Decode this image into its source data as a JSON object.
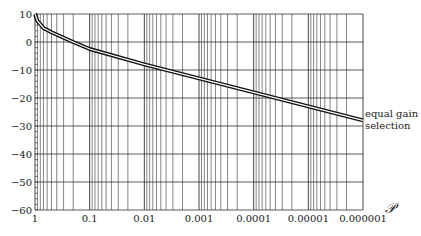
{
  "chart_data": {
    "type": "line",
    "title": "",
    "xlabel": "𝒫",
    "ylabel": "",
    "xscale": "log",
    "x_reversed": true,
    "xlim": [
      1,
      1e-06
    ],
    "ylim": [
      -60,
      10
    ],
    "grid": true,
    "x_ticks": [
      "1",
      "0.1",
      "0.01",
      "0.001",
      "0.0001",
      "0.00001",
      "0.000001"
    ],
    "y_ticks": [
      "10",
      "0",
      "−10",
      "−20",
      "−30",
      "−40",
      "−50",
      "−60"
    ],
    "series": [
      {
        "name": "equal gain selection",
        "x": [
          1,
          0.9,
          0.7,
          0.5,
          0.3,
          0.2,
          0.1,
          0.01,
          0.001,
          0.0001,
          1e-05,
          1e-06
        ],
        "values": [
          10,
          7.5,
          5,
          3.5,
          1.5,
          0,
          -2.5,
          -8,
          -13,
          -18,
          -23,
          -28
        ]
      }
    ],
    "annotations": [
      {
        "text_line1": "equal gain",
        "text_line2": "selection",
        "position": "right of curve end"
      }
    ]
  }
}
